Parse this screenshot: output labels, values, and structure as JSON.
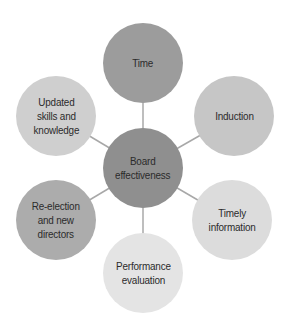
{
  "diagram": {
    "type": "hub-and-spoke",
    "center": {
      "label": "Board\neffectiveness",
      "cx": 143,
      "cy": 168,
      "r": 40,
      "color": "#8f8f8f"
    },
    "nodes": [
      {
        "id": "time",
        "label": "Time",
        "cx": 143,
        "cy": 63,
        "r": 40,
        "color": "#9c9c9c"
      },
      {
        "id": "induction",
        "label": "Induction",
        "cx": 234,
        "cy": 116,
        "r": 40,
        "color": "#c6c6c6"
      },
      {
        "id": "timely-information",
        "label": "Timely\ninformation",
        "cx": 232,
        "cy": 220,
        "r": 40,
        "color": "#dcdcdc"
      },
      {
        "id": "performance-evaluation",
        "label": "Performance\nevaluation",
        "cx": 143,
        "cy": 273,
        "r": 40,
        "color": "#e4e4e4"
      },
      {
        "id": "re-election",
        "label": "Re-election\nand new\ndirectors",
        "cx": 56,
        "cy": 220,
        "r": 40,
        "color": "#acacac"
      },
      {
        "id": "updated-skills",
        "label": "Updated\nskills and\nknowledge",
        "cx": 56,
        "cy": 116,
        "r": 40,
        "color": "#cfcfcf"
      }
    ],
    "connector_color": "#a8a8a8"
  }
}
